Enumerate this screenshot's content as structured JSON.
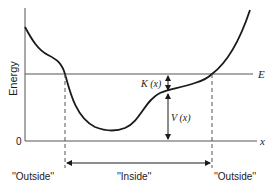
{
  "diagram": {
    "y_axis_label": "Energy",
    "origin_label": "0",
    "x_axis_label": "x",
    "energy_line_label": "E",
    "kinetic_label": "K (x)",
    "potential_label": "V (x)",
    "regions": {
      "left": "''Outside''",
      "middle": "''Inside''",
      "right": "''Outside''"
    },
    "colors": {
      "ink": "#1a1a1a",
      "line": "#555555",
      "background": "#ffffff"
    }
  }
}
